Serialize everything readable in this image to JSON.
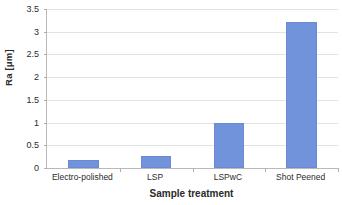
{
  "chart_data": {
    "type": "bar",
    "title": "",
    "categories": [
      "Electro-polished",
      "LSP",
      "LSPwC",
      "Shot Peened"
    ],
    "values": [
      0.17,
      0.26,
      1.0,
      3.22
    ],
    "series": [
      {
        "name": "Ra",
        "values": [
          0.17,
          0.26,
          1.0,
          3.22
        ]
      }
    ],
    "xlabel": "Sample treatment",
    "ylabel": "Ra [μm]",
    "ylim": [
      0,
      3.5
    ],
    "y_ticks": [
      "0",
      "0.5",
      "1",
      "1.5",
      "2",
      "2.5",
      "3",
      "3.5"
    ],
    "y_tick_values": [
      0,
      0.5,
      1,
      1.5,
      2,
      2.5,
      3,
      3.5
    ],
    "grid": true,
    "legend": false,
    "legend_position": "none",
    "bar_color": "#7093DB",
    "gridline_color": "#E2E2E2",
    "axis_color": "#B9B9B9",
    "background_color": "#FFFFFF"
  }
}
